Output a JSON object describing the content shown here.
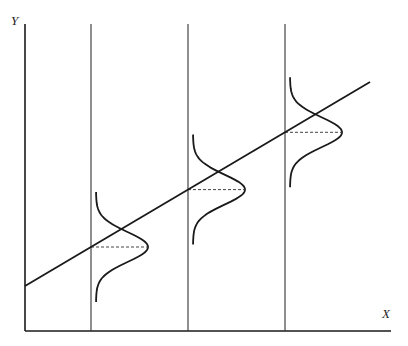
{
  "diagram": {
    "title": "",
    "axes": {
      "x_label": "X",
      "y_label": "Y"
    },
    "regression_line": {
      "description": "linear regression of Y on X"
    },
    "conditional_distributions": [
      {
        "name": "distribution-1",
        "shape": "normal",
        "at_x_index": 1
      },
      {
        "name": "distribution-2",
        "shape": "normal",
        "at_x_index": 2
      },
      {
        "name": "distribution-3",
        "shape": "normal",
        "at_x_index": 3
      }
    ],
    "colors": {
      "line": "#1a1a1a",
      "background": "#ffffff"
    }
  }
}
